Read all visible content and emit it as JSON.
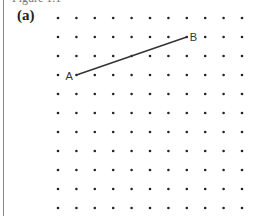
{
  "figure": {
    "caption_partial": "Figure 1.1",
    "part_label": "(a)"
  },
  "grid": {
    "columns": 11,
    "rows": 11,
    "origin_x": 58,
    "origin_y": 18,
    "spacing_x": 18.4,
    "spacing_y": 19,
    "dot_radius": 1.3,
    "dot_color": "#222222"
  },
  "segment": {
    "color": "#333333",
    "points": [
      {
        "name": "A",
        "label": "A",
        "col": 1,
        "row": 3
      },
      {
        "name": "B",
        "label": "B",
        "col": 7,
        "row": 1
      }
    ]
  }
}
